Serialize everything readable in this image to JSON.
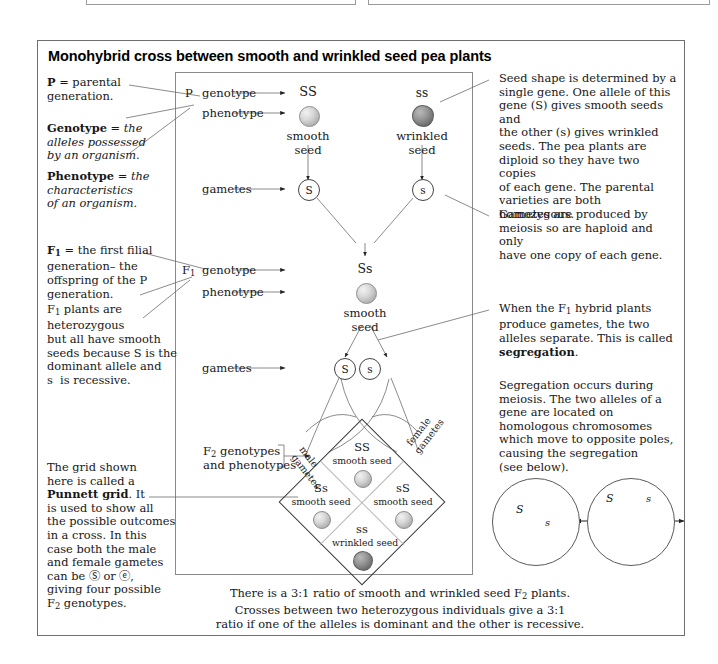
{
  "title": "Monohybrid cross between smooth and wrinkled seed pea plants",
  "left_notes": [
    {
      "id": "note-p",
      "html": "<b>P</b> = parental<br>generation."
    },
    {
      "id": "note-genotype",
      "html": "<b>Genotype</b> = <i>the</i><br><i>alleles possessed</i><br><i>by an organism.</i>"
    },
    {
      "id": "note-phenotype",
      "html": "<b>Phenotype</b> = <i>the</i><br><i>characteristics</i><br><i>of an organism.</i>"
    },
    {
      "id": "note-f1",
      "html": "<b>F<span class='sub'>1</span></b> = the first filial<br>generation&ndash; the<br>offspring of the P<br>generation."
    },
    {
      "id": "note-f1-hetero",
      "html": "F<span class='sub'>1</span> plants are<br>heterozygous<br>but all have smooth<br>seeds because S is the<br>dominant allele and<br>s&nbsp; is recessive."
    },
    {
      "id": "note-punnett",
      "html": "The grid shown<br>here is called a<br><b>Punnett grid</b>. It<br>is used to show all<br>the possible outcomes<br>in a cross. In this<br>case both the male<br>and female gametes<br>can be &#9416; or &#9428;,<br>giving four possible<br>F<span class='sub'>2</span> genotypes."
    }
  ],
  "right_notes": [
    {
      "id": "note-seed-shape",
      "html": "Seed shape is determined by a<br>single gene. One allele of this<br>gene (S) gives smooth seeds and<br>the other (s) gives wrinkled<br>seeds. The pea plants are<br>diploid so they have two copies<br>of each gene. The parental<br>varieties are both homozygous."
    },
    {
      "id": "note-gametes-meiosis",
      "html": "Gametes are produced by<br>meiosis so are haploid and only<br>have one copy of each gene."
    },
    {
      "id": "note-segregation",
      "html": "When the F<span class='sub'>1</span> hybrid plants<br>produce gametes, the two<br>alleles separate. This is called<br><b>segregation</b>."
    },
    {
      "id": "note-meiosis-detail",
      "html": "Segregation occurs during<br>meiosis. The two alleles of a<br>gene are located on<br>homologous chromosomes<br>which move to opposite poles,<br>causing the segregation<br>(see below)."
    }
  ],
  "diagram": {
    "p_generation": {
      "row_label": "P",
      "genotype_label": "genotype",
      "phenotype_label": "phenotype",
      "gametes_label": "gametes",
      "parent_left": {
        "genotype": "SS",
        "phenotype_line1": "smooth",
        "phenotype_line2": "seed",
        "gamete": "S"
      },
      "parent_right": {
        "genotype": "ss",
        "phenotype_line1": "wrinkled",
        "phenotype_line2": "seed",
        "gamete": "s"
      }
    },
    "f1_generation": {
      "row_label": "F",
      "row_label_sub": "1",
      "genotype_label": "genotype",
      "phenotype_label": "phenotype",
      "gametes_label": "gametes",
      "genotype": "Ss",
      "phenotype_line1": "smooth",
      "phenotype_line2": "seed",
      "gamete_left": "S",
      "gamete_right": "s"
    },
    "f2_generation": {
      "label_line1": "F",
      "label_line1_sub": "2",
      "label_line1_rest": " genotypes",
      "label_line2": "and phenotypes",
      "male_gametes_label_line1": "male",
      "male_gametes_label_line2": "gametes",
      "female_gametes_label_line1": "female",
      "female_gametes_label_line2": "gametes",
      "cells": [
        {
          "position": "top",
          "genotype": "SS",
          "phenotype": "smooth seed",
          "seed": "smooth"
        },
        {
          "position": "left",
          "genotype": "Ss",
          "phenotype": "smooth seed",
          "seed": "smooth"
        },
        {
          "position": "right",
          "genotype": "sS",
          "phenotype": "smooth seed",
          "seed": "smooth"
        },
        {
          "position": "bottom",
          "genotype": "ss",
          "phenotype": "wrinkled seed",
          "seed": "wrinkled"
        }
      ]
    }
  },
  "bottom_caption": {
    "line1_pre": "There is a 3:1 ratio of smooth and wrinkled seed F",
    "line1_sub": "2",
    "line1_post": " plants.",
    "line2": "Crosses between two heterozygous individuals give a 3:1",
    "line3": "ratio if one of the alleles is dominant and the other is recessive."
  },
  "meiosis_circles": {
    "left": {
      "allele_top": "S",
      "allele_bottom": "s"
    },
    "right": {
      "allele_left": "S",
      "allele_right": "s"
    }
  }
}
